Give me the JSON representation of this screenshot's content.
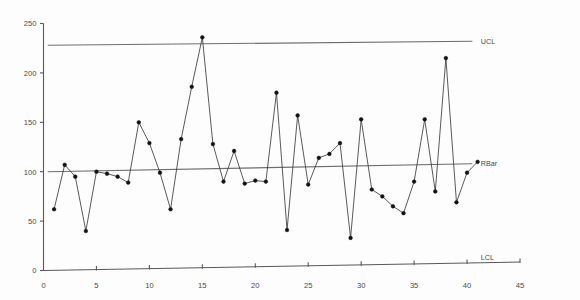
{
  "chart_data": {
    "type": "line",
    "title": "",
    "subtitle": "",
    "xlabel": "",
    "ylabel": "",
    "xlim": [
      0,
      45
    ],
    "ylim": [
      0,
      250
    ],
    "grid": false,
    "legend_position": "inline-right",
    "x_ticks": [
      0,
      5,
      10,
      15,
      20,
      25,
      30,
      35,
      40,
      45
    ],
    "y_ticks": [
      0,
      50,
      100,
      150,
      200,
      250
    ],
    "x_tick_labels": [
      "0",
      "5",
      "10",
      "15",
      "20",
      "25",
      "30",
      "35",
      "40",
      "45"
    ],
    "y_tick_labels": [
      "0",
      "50",
      "100",
      "150",
      "200",
      "250"
    ],
    "series": [
      {
        "name": "Range",
        "x": [
          1,
          2,
          3,
          4,
          5,
          6,
          7,
          8,
          9,
          10,
          11,
          12,
          13,
          14,
          15,
          16,
          17,
          18,
          19,
          20,
          21,
          22,
          23,
          24,
          25,
          26,
          27,
          28,
          29,
          30,
          31,
          32,
          33,
          34,
          35,
          36,
          37,
          38,
          39,
          40,
          41
        ],
        "values": [
          62,
          107,
          95,
          40,
          100,
          98,
          95,
          89,
          150,
          129,
          99,
          62,
          133,
          186,
          236,
          128,
          90,
          121,
          88,
          91,
          90,
          180,
          41,
          157,
          87,
          114,
          118,
          129,
          33,
          153,
          82,
          75,
          65,
          58,
          90,
          153,
          80,
          215,
          69,
          99,
          110
        ]
      }
    ],
    "reference_lines": [
      {
        "name": "UCL",
        "label": "UCL",
        "y_left": 228,
        "y_right": 232
      },
      {
        "name": "RBar",
        "label": "RBar",
        "y_left": 100,
        "y_right": 108
      },
      {
        "name": "LCL",
        "label": "LCL",
        "y_left": 0,
        "y_right": 0
      }
    ]
  },
  "colors": {
    "background": "#fdfdfd",
    "axis": "#58585a",
    "series_line": "#3c3c3e",
    "marker": "#121214",
    "limit_line": "#6e6e70",
    "tick_text": "#4a4a4c"
  }
}
